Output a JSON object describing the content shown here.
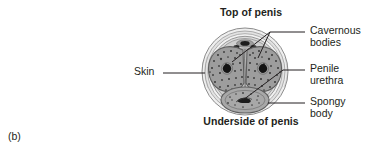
{
  "figure": {
    "letter": "(b)",
    "orientation_top": "Top of penis",
    "orientation_bottom": "Underside of penis"
  },
  "labels": {
    "skin": "Skin",
    "cavernous_line1": "Cavernous",
    "cavernous_line2": "bodies",
    "urethra_line1": "Penile",
    "urethra_line2": "urethra",
    "spongy_line1": "Spongy",
    "spongy_line2": "body"
  },
  "colors": {
    "background": "#ffffff",
    "text": "#231f20",
    "leader_line": "#231f20",
    "skin_outer": "#e8e8e8",
    "skin_mid": "#d2d2d2",
    "tunica": "#b4b4b4",
    "cavernous_fill": "#9d9d9d",
    "spongy_fill": "#a8a8a8",
    "artery_dark": "#1a1a1a",
    "vessel_dark": "#2a2a2a"
  },
  "diagram": {
    "type": "anatomical-cross-section",
    "structures": [
      "skin",
      "cavernous bodies",
      "penile urethra",
      "spongy body",
      "dorsal vessels"
    ]
  }
}
